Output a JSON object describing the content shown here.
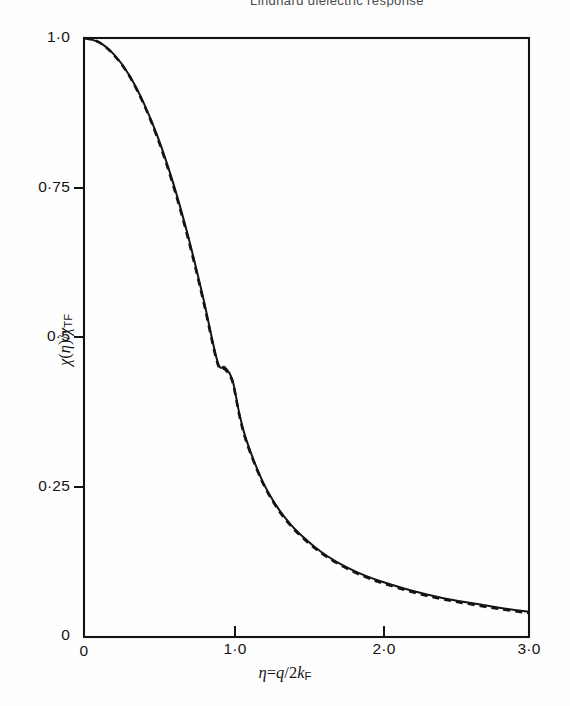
{
  "figure": {
    "background_color": "#fefefe",
    "ink_color": "#141414",
    "scan_artifact_text": "Lindhard dielectric response",
    "y_axis_title": "χ(η)/χTF",
    "x_axis_title": "η=q/2kF"
  },
  "chart_data": {
    "type": "line",
    "title": "",
    "subtitle": "",
    "xlabel": "η=q/2kF",
    "ylabel": "χ(η)/χTF",
    "xlim": [
      0,
      3.0
    ],
    "ylim": [
      0,
      1.0
    ],
    "grid": false,
    "legend_position": "none",
    "x_tick_values": [
      0,
      1.0,
      2.0,
      3.0
    ],
    "x_tick_labels": [
      "0",
      "1·0",
      "2·0",
      "3·0"
    ],
    "y_tick_values": [
      0,
      0.25,
      0.5,
      0.75,
      1.0
    ],
    "y_tick_labels": [
      "0",
      "0·25",
      "0·5",
      "0·75",
      "1·0"
    ],
    "x": [
      0.0,
      0.1,
      0.2,
      0.3,
      0.4,
      0.5,
      0.6,
      0.7,
      0.8,
      0.9,
      0.95,
      1.0,
      1.05,
      1.1,
      1.2,
      1.3,
      1.4,
      1.5,
      1.6,
      1.7,
      1.8,
      1.9,
      2.0,
      2.2,
      2.4,
      2.6,
      2.8,
      3.0
    ],
    "series": [
      {
        "name": "solid-curve",
        "style": "solid",
        "color": "#141414",
        "values": [
          1.0,
          0.993,
          0.973,
          0.94,
          0.893,
          0.833,
          0.759,
          0.671,
          0.57,
          0.46,
          0.45,
          0.43,
          0.37,
          0.325,
          0.262,
          0.218,
          0.186,
          0.162,
          0.142,
          0.126,
          0.113,
          0.102,
          0.093,
          0.078,
          0.066,
          0.057,
          0.049,
          0.042
        ]
      },
      {
        "name": "dashed-curve",
        "style": "dashed",
        "color": "#141414",
        "values": [
          1.0,
          0.993,
          0.972,
          0.939,
          0.891,
          0.83,
          0.755,
          0.667,
          0.566,
          0.457,
          0.447,
          0.427,
          0.367,
          0.322,
          0.26,
          0.216,
          0.184,
          0.16,
          0.14,
          0.124,
          0.111,
          0.1,
          0.091,
          0.076,
          0.064,
          0.055,
          0.047,
          0.04
        ]
      }
    ]
  }
}
